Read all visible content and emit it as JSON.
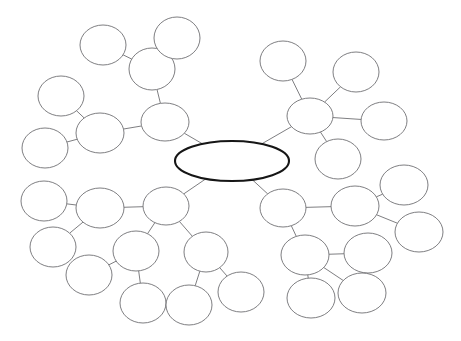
{
  "document": {
    "title": "Concept Map Template",
    "background_color": "#ffffff",
    "node_fill": "#ffffff",
    "node_stroke": "#6f6f73",
    "central_stroke": "#161616",
    "edge_color": "#6f6f73"
  },
  "chart_data": {
    "type": "diagram",
    "diagram_kind": "concept-map",
    "title": "",
    "node_count": 29,
    "edge_count": 28,
    "all_labels_empty": true,
    "nodes": [
      {
        "id": "center",
        "label": "",
        "cx": 232,
        "cy": 161,
        "rx": 57,
        "ry": 20,
        "role": "central-topic"
      },
      {
        "id": "tl-hub",
        "label": "",
        "cx": 165,
        "cy": 122,
        "rx": 24,
        "ry": 19,
        "role": "branch-hub"
      },
      {
        "id": "tl-a",
        "label": "",
        "cx": 152,
        "cy": 69,
        "rx": 23,
        "ry": 21,
        "role": "sub-node"
      },
      {
        "id": "tl-a1",
        "label": "",
        "cx": 103,
        "cy": 45,
        "rx": 23,
        "ry": 20,
        "role": "leaf"
      },
      {
        "id": "tl-a2",
        "label": "",
        "cx": 177,
        "cy": 38,
        "rx": 23,
        "ry": 21,
        "role": "leaf"
      },
      {
        "id": "tl-b",
        "label": "",
        "cx": 100,
        "cy": 133,
        "rx": 24,
        "ry": 20,
        "role": "sub-node"
      },
      {
        "id": "tl-b1",
        "label": "",
        "cx": 61,
        "cy": 96,
        "rx": 23,
        "ry": 20,
        "role": "leaf"
      },
      {
        "id": "tl-b2",
        "label": "",
        "cx": 45,
        "cy": 148,
        "rx": 23,
        "ry": 20,
        "role": "leaf"
      },
      {
        "id": "tr-hub",
        "label": "",
        "cx": 310,
        "cy": 116,
        "rx": 23,
        "ry": 18,
        "role": "branch-hub"
      },
      {
        "id": "tr-a",
        "label": "",
        "cx": 283,
        "cy": 61,
        "rx": 23,
        "ry": 20,
        "role": "leaf"
      },
      {
        "id": "tr-b",
        "label": "",
        "cx": 356,
        "cy": 72,
        "rx": 23,
        "ry": 20,
        "role": "leaf"
      },
      {
        "id": "tr-c",
        "label": "",
        "cx": 384,
        "cy": 121,
        "rx": 23,
        "ry": 19,
        "role": "leaf"
      },
      {
        "id": "tr-d",
        "label": "",
        "cx": 338,
        "cy": 159,
        "rx": 23,
        "ry": 20,
        "role": "leaf"
      },
      {
        "id": "bl-hub",
        "label": "",
        "cx": 166,
        "cy": 206,
        "rx": 23,
        "ry": 19,
        "role": "branch-hub"
      },
      {
        "id": "bl-a",
        "label": "",
        "cx": 100,
        "cy": 208,
        "rx": 24,
        "ry": 20,
        "role": "sub-node"
      },
      {
        "id": "bl-a1",
        "label": "",
        "cx": 44,
        "cy": 201,
        "rx": 23,
        "ry": 20,
        "role": "leaf"
      },
      {
        "id": "bl-a2",
        "label": "",
        "cx": 53,
        "cy": 247,
        "rx": 23,
        "ry": 20,
        "role": "leaf"
      },
      {
        "id": "bl-b",
        "label": "",
        "cx": 136,
        "cy": 251,
        "rx": 23,
        "ry": 20,
        "role": "sub-node"
      },
      {
        "id": "bl-b1",
        "label": "",
        "cx": 89,
        "cy": 275,
        "rx": 23,
        "ry": 20,
        "role": "leaf"
      },
      {
        "id": "bl-b2",
        "label": "",
        "cx": 143,
        "cy": 303,
        "rx": 23,
        "ry": 20,
        "role": "leaf"
      },
      {
        "id": "bl-c",
        "label": "",
        "cx": 206,
        "cy": 252,
        "rx": 22,
        "ry": 20,
        "role": "sub-node"
      },
      {
        "id": "bl-c1",
        "label": "",
        "cx": 189,
        "cy": 305,
        "rx": 23,
        "ry": 20,
        "role": "leaf"
      },
      {
        "id": "bl-c2",
        "label": "",
        "cx": 241,
        "cy": 292,
        "rx": 23,
        "ry": 20,
        "role": "leaf"
      },
      {
        "id": "br-hub",
        "label": "",
        "cx": 283,
        "cy": 208,
        "rx": 23,
        "ry": 19,
        "role": "branch-hub"
      },
      {
        "id": "br-a",
        "label": "",
        "cx": 355,
        "cy": 206,
        "rx": 24,
        "ry": 20,
        "role": "sub-node"
      },
      {
        "id": "br-a1",
        "label": "",
        "cx": 404,
        "cy": 185,
        "rx": 24,
        "ry": 20,
        "role": "leaf"
      },
      {
        "id": "br-a2",
        "label": "",
        "cx": 419,
        "cy": 232,
        "rx": 24,
        "ry": 20,
        "role": "leaf"
      },
      {
        "id": "br-b",
        "label": "",
        "cx": 305,
        "cy": 255,
        "rx": 24,
        "ry": 20,
        "role": "sub-node"
      },
      {
        "id": "br-b1",
        "label": "",
        "cx": 368,
        "cy": 253,
        "rx": 24,
        "ry": 20,
        "role": "leaf"
      },
      {
        "id": "br-b2",
        "label": "",
        "cx": 311,
        "cy": 298,
        "rx": 24,
        "ry": 20,
        "role": "leaf"
      },
      {
        "id": "br-b3",
        "label": "",
        "cx": 362,
        "cy": 293,
        "rx": 24,
        "ry": 20,
        "role": "leaf"
      }
    ],
    "edges": [
      {
        "from": "center",
        "to": "tl-hub"
      },
      {
        "from": "tl-hub",
        "to": "tl-a"
      },
      {
        "from": "tl-a",
        "to": "tl-a1"
      },
      {
        "from": "tl-a",
        "to": "tl-a2"
      },
      {
        "from": "tl-hub",
        "to": "tl-b"
      },
      {
        "from": "tl-b",
        "to": "tl-b1"
      },
      {
        "from": "tl-b",
        "to": "tl-b2"
      },
      {
        "from": "center",
        "to": "tr-hub"
      },
      {
        "from": "tr-hub",
        "to": "tr-a"
      },
      {
        "from": "tr-hub",
        "to": "tr-b"
      },
      {
        "from": "tr-hub",
        "to": "tr-c"
      },
      {
        "from": "tr-hub",
        "to": "tr-d"
      },
      {
        "from": "center",
        "to": "bl-hub"
      },
      {
        "from": "bl-hub",
        "to": "bl-a"
      },
      {
        "from": "bl-a",
        "to": "bl-a1"
      },
      {
        "from": "bl-a",
        "to": "bl-a2"
      },
      {
        "from": "bl-hub",
        "to": "bl-b"
      },
      {
        "from": "bl-b",
        "to": "bl-b1"
      },
      {
        "from": "bl-b",
        "to": "bl-b2"
      },
      {
        "from": "bl-hub",
        "to": "bl-c"
      },
      {
        "from": "bl-c",
        "to": "bl-c1"
      },
      {
        "from": "bl-c",
        "to": "bl-c2"
      },
      {
        "from": "center",
        "to": "br-hub"
      },
      {
        "from": "br-hub",
        "to": "br-a"
      },
      {
        "from": "br-a",
        "to": "br-a1"
      },
      {
        "from": "br-a",
        "to": "br-a2"
      },
      {
        "from": "br-hub",
        "to": "br-b"
      },
      {
        "from": "br-b",
        "to": "br-b1"
      },
      {
        "from": "br-b",
        "to": "br-b2"
      },
      {
        "from": "br-b",
        "to": "br-b3"
      }
    ]
  }
}
